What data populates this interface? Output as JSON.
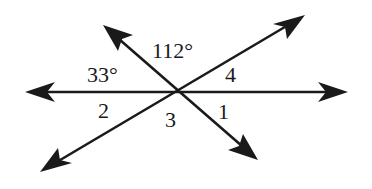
{
  "diagram": {
    "type": "intersecting-lines",
    "vertex": [
      181,
      92
    ],
    "lines": [
      {
        "name": "horizontal",
        "from": [
          25,
          92
        ],
        "to": [
          348,
          92
        ]
      },
      {
        "name": "descending",
        "from": [
          103,
          25
        ],
        "to": [
          258,
          160
        ]
      },
      {
        "name": "ascending",
        "from": [
          40,
          172
        ],
        "to": [
          305,
          15
        ]
      }
    ],
    "labels": [
      {
        "id": "angle-112",
        "text": "112°",
        "x": 152,
        "y": 58
      },
      {
        "id": "angle-33",
        "text": "33°",
        "x": 87,
        "y": 82
      },
      {
        "id": "angle-4",
        "text": "4",
        "x": 225,
        "y": 82
      },
      {
        "id": "angle-2",
        "text": "2",
        "x": 98,
        "y": 118
      },
      {
        "id": "angle-3",
        "text": "3",
        "x": 165,
        "y": 127
      },
      {
        "id": "angle-1",
        "text": "1",
        "x": 218,
        "y": 119
      }
    ]
  }
}
